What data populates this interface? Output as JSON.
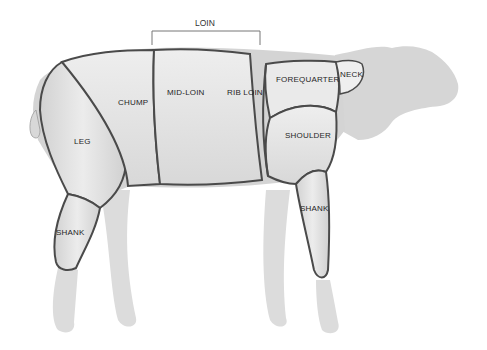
{
  "diagram": {
    "group_bracket": {
      "label": "LOIN",
      "spans": [
        "MID-LOIN",
        "RIB LOIN"
      ]
    },
    "cuts": [
      {
        "id": "leg",
        "label": "LEG"
      },
      {
        "id": "chump",
        "label": "CHUMP"
      },
      {
        "id": "mid-loin",
        "label": "MID-LOIN"
      },
      {
        "id": "rib-loin",
        "label": "RIB LOIN"
      },
      {
        "id": "forequarter",
        "label": "FOREQUARTER"
      },
      {
        "id": "neck",
        "label": "NECK"
      },
      {
        "id": "shoulder",
        "label": "SHOULDER"
      },
      {
        "id": "hind-shank",
        "label": "SHANK"
      },
      {
        "id": "fore-shank",
        "label": "SHANK"
      }
    ],
    "colors": {
      "body_unmarked": "#d4d4d4",
      "cut_fill": "#e6e6e6",
      "cut_line": "#4a4a4a",
      "bracket": "#777777"
    }
  }
}
